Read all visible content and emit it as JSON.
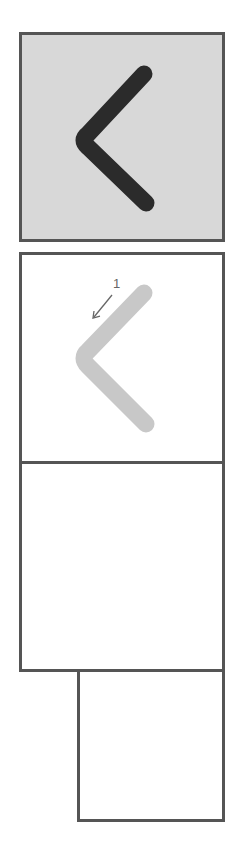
{
  "diagram": {
    "type": "stroke-order-practice-sheet",
    "character": "く",
    "stroke_count": 1,
    "model_box": {
      "background": "#d8d8d8",
      "stroke_color": "#2b2b2b"
    },
    "stroke_boxes": [
      {
        "stroke_number": "1",
        "stroke_color": "#c8c8c8",
        "arrow_color": "#666666",
        "direction": "down-left"
      }
    ],
    "practice_boxes": 2,
    "border_color": "#555555"
  }
}
